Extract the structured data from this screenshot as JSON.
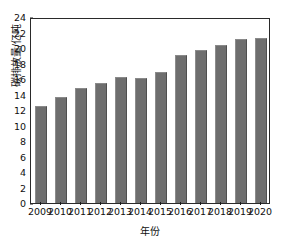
{
  "chart_data": {
    "type": "bar",
    "title": "",
    "xlabel": "年份",
    "ylabel": "碳排放量/亿吨",
    "categories": [
      "2009",
      "2010",
      "2011",
      "2012",
      "2013",
      "2014",
      "2015",
      "2016",
      "2017",
      "2018",
      "2019",
      "2020"
    ],
    "values": [
      12.5,
      13.7,
      14.8,
      15.5,
      16.2,
      16.1,
      16.9,
      19.1,
      19.8,
      20.4,
      21.2,
      21.3
    ],
    "ylim": [
      0,
      24
    ],
    "yticks": [
      0,
      2,
      4,
      6,
      8,
      10,
      12,
      14,
      16,
      18,
      20,
      22,
      24
    ],
    "ytick_labels": [
      "0",
      "2",
      "4",
      "6",
      "8",
      "10",
      "12",
      "14",
      "16",
      "18",
      "20",
      "22",
      "24"
    ],
    "grid": false,
    "legend": null,
    "series": [
      {
        "name": "碳排放量",
        "color": "#6e6e6e",
        "values": [
          12.5,
          13.7,
          14.8,
          15.5,
          16.2,
          16.1,
          16.9,
          19.1,
          19.8,
          20.4,
          21.2,
          21.3
        ]
      }
    ]
  },
  "colors": {
    "bar": "#6e6e6e",
    "bar_edge_light": "#8a8a8a",
    "bar_edge_dark": "#4f4f4f",
    "axis": "#2a2a2a",
    "text": "#101010",
    "background": "#ffffff"
  }
}
